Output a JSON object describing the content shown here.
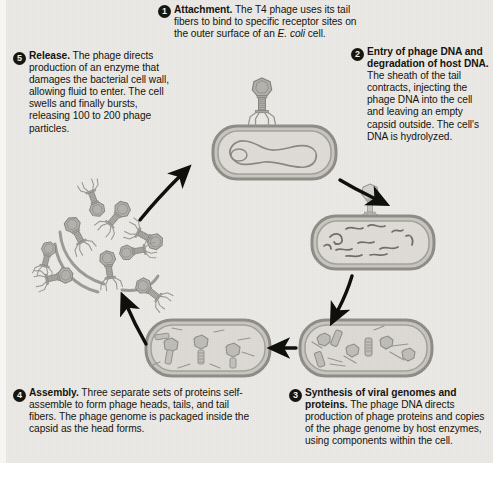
{
  "figure": {
    "background_color": "#eceae6",
    "organism": "E. coli",
    "virus": "T4 phage"
  },
  "steps": [
    {
      "number": "1",
      "heading": "Attachment.",
      "body_pre": " The T4 phage uses its tail fibers to bind to specific receptor sites on the outer surface of an ",
      "italic": "E. coli",
      "body_post": " cell.",
      "position": "top-center"
    },
    {
      "number": "2",
      "heading": "Entry of phage DNA and degradation of host DNA.",
      "body_pre": " The sheath of the tail contracts, injecting the phage DNA into the cell and leaving an empty capsid outside. The cell's DNA is hydrolyzed.",
      "italic": "",
      "body_post": "",
      "position": "right-top"
    },
    {
      "number": "3",
      "heading": "Synthesis of viral genomes and proteins.",
      "body_pre": " The phage DNA directs production of phage proteins and copies of the phage genome by host enzymes, using components within the cell.",
      "italic": "",
      "body_post": "",
      "position": "bottom-right"
    },
    {
      "number": "4",
      "heading": "Assembly.",
      "body_pre": " Three separate sets of proteins self-assemble to form phage heads, tails, and tail fibers. The phage genome is packaged inside the capsid as the head forms.",
      "italic": "",
      "body_post": "",
      "position": "bottom-left"
    },
    {
      "number": "5",
      "heading": "Release.",
      "body_pre": " The phage directs production of an enzyme that damages the bacterial cell wall, allowing fluid to enter. The cell swells and finally bursts, releasing 100 to 200 phage particles.",
      "italic": "",
      "body_post": "",
      "position": "left-top"
    }
  ],
  "illustrations": [
    {
      "name": "phage-attached-to-bacterium",
      "label": "T4 phage attached to intact E. coli cell with circular chromosome"
    },
    {
      "name": "bacterium-with-degraded-dna",
      "label": "Empty capsid on cell surface; host DNA fragmented inside"
    },
    {
      "name": "bacterium-with-phage-parts",
      "label": "Cell filled with separately synthesized phage heads, tails and tail fibers"
    },
    {
      "name": "bacterium-with-assembled-phages",
      "label": "Cell containing fully assembled phage particles"
    },
    {
      "name": "burst-cell-releasing-phages",
      "label": "Lysed cell releasing many complete phage particles"
    }
  ],
  "arrows": [
    {
      "name": "arrow-step1-to-step2",
      "from": "1",
      "to": "2"
    },
    {
      "name": "arrow-step2-to-step3",
      "from": "2",
      "to": "3"
    },
    {
      "name": "arrow-step3-to-step4",
      "from": "3",
      "to": "4"
    },
    {
      "name": "arrow-step4-to-step5",
      "from": "4",
      "to": "5"
    },
    {
      "name": "arrow-step5-to-step1",
      "from": "5",
      "to": "1"
    }
  ],
  "colors": {
    "badge": "#17150f",
    "text": "#15140f",
    "arrow": "#0d0d0b",
    "cell_wall": "#9a9a94",
    "cell_interior": "#dcd9d3",
    "phage": "#a8a7a1"
  }
}
